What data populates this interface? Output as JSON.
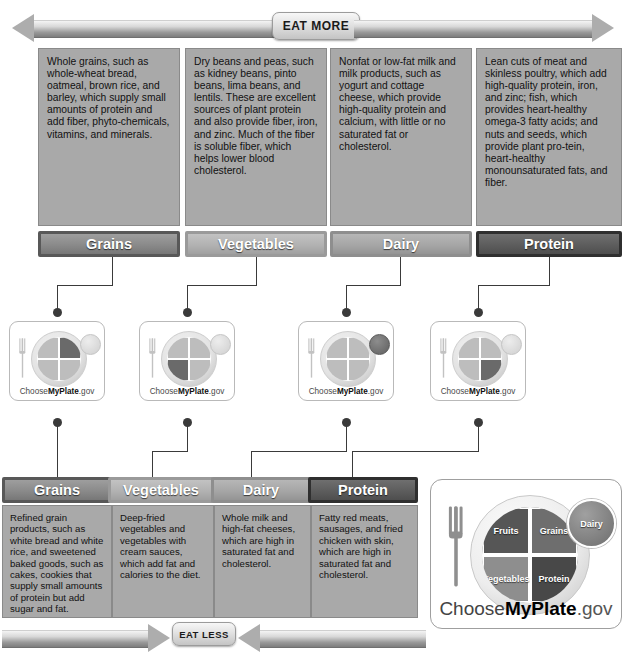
{
  "top_banner": {
    "label": "EAT MORE"
  },
  "bottom_banner": {
    "label": "EAT LESS"
  },
  "eat_more": {
    "columns": [
      {
        "key": "grains",
        "label": "Grains",
        "description": "Whole grains, such as whole-wheat bread, oatmeal, brown rice, and barley, which supply small amounts of protein and add fiber, phyto-chemicals, vitamins, and minerals."
      },
      {
        "key": "vegetables",
        "label": "Vegetables",
        "description": "Dry beans and peas, such as kidney beans, pinto beans, lima beans, and lentils. These are excellent sources of plant protein and also provide fiber, iron, and zinc. Much of the fiber is soluble fiber, which helps lower blood cholesterol."
      },
      {
        "key": "dairy",
        "label": "Dairy",
        "description": "Nonfat or low-fat milk and milk products, such as yogurt and cottage cheese, which provide high-quality protein and calcium, with little or no saturated fat or cholesterol."
      },
      {
        "key": "protein",
        "label": "Protein",
        "description": "Lean cuts of meat and skinless poultry, which add high-quality protein, iron, and zinc; fish, which provides heart-healthy omega-3 fatty acids; and nuts and seeds, which provide plant pro-tein, heart-healthy monounsaturated fats, and fiber."
      }
    ]
  },
  "eat_less": {
    "columns": [
      {
        "key": "grains",
        "label": "Grains",
        "description": "Refined grain products, such as white bread and white rice, and sweetened baked goods, such as cakes, cookies that supply small amounts of protein but add sugar and fat."
      },
      {
        "key": "vegetables",
        "label": "Vegetables",
        "description": "Deep-fried vegetables and vegetables with cream sauces, which add fat and calories to the diet."
      },
      {
        "key": "dairy",
        "label": "Dairy",
        "description": "Whole milk and high-fat cheeses, which are high in saturated fat and cholesterol."
      },
      {
        "key": "protein",
        "label": "Protein",
        "description": "Fatty red meats, sausages, and fried chicken with skin, which are high in saturated fat and cholesterol."
      }
    ]
  },
  "plate_icons": [
    {
      "key": "grains",
      "highlight": "top-right",
      "caption_pre": "Choose",
      "caption_bold": "MyPlate",
      "caption_post": ".gov"
    },
    {
      "key": "vegetables",
      "highlight": "bottom-left",
      "caption_pre": "Choose",
      "caption_bold": "MyPlate",
      "caption_post": ".gov"
    },
    {
      "key": "dairy",
      "highlight": "dairy-circle",
      "caption_pre": "Choose",
      "caption_bold": "MyPlate",
      "caption_post": ".gov"
    },
    {
      "key": "protein",
      "highlight": "bottom-right",
      "caption_pre": "Choose",
      "caption_bold": "MyPlate",
      "caption_post": ".gov"
    }
  ],
  "myplate_logo": {
    "segments": {
      "fruits": "Fruits",
      "grains": "Grains",
      "vegetables": "Vegetables",
      "protein": "Protein",
      "dairy": "Dairy"
    },
    "caption_pre": "Choose",
    "caption_bold": "MyPlate",
    "caption_post": ".gov"
  },
  "colors": {
    "box_fill": "#a9a9a9",
    "bar_grains": "#8a8a8a",
    "bar_vegetables": "#b2b2b2",
    "bar_dairy": "#a6a6a6",
    "bar_protein": "#5d5d5d",
    "connector": "#3a3a3a",
    "page_background": "#ffffff"
  }
}
